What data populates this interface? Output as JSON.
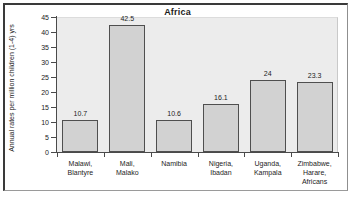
{
  "chart_data": {
    "type": "bar",
    "title": "Africa",
    "xlabel": "",
    "ylabel": "Annual rates per million children (1-4) yrs",
    "ylim": [
      0,
      45
    ],
    "yticks": [
      0,
      5,
      10,
      15,
      20,
      25,
      30,
      35,
      40,
      45
    ],
    "ytick_labels": [
      "0",
      "5",
      "10",
      "15",
      "20",
      "25",
      "30",
      "35",
      "40",
      "45"
    ],
    "grid": false,
    "legend": "none",
    "categories": [
      "Malawi, Blantyre",
      "Mali, Malako",
      "Namibia",
      "Nigeria, Ibadan",
      "Uganda, Kampala",
      "Zimbabwe, Harare, Africans"
    ],
    "category_lines": [
      [
        "Malawi,",
        "Blantyre"
      ],
      [
        "Mali,",
        "Malako"
      ],
      [
        "Namibia"
      ],
      [
        "Nigeria,",
        "Ibadan"
      ],
      [
        "Uganda,",
        "Kampala"
      ],
      [
        "Zimbabwe,",
        "Harare,",
        "Africans"
      ]
    ],
    "values": [
      10.7,
      42.5,
      10.6,
      16.1,
      24,
      23.3
    ],
    "value_labels": [
      "10.7",
      "42.5",
      "10.6",
      "16.1",
      "24",
      "23.3"
    ],
    "colors": {
      "bar_fill": "#d2d2d2",
      "bar_edge": "#4f4f4f",
      "plot_background": "#ececec",
      "axis": "#4a4a4a",
      "text": "#1c1c1c",
      "frame": "#3a3a3a"
    }
  }
}
